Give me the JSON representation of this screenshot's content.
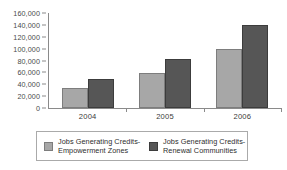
{
  "chart_data": {
    "type": "bar",
    "title": "",
    "subtitle": "",
    "xlabel": "",
    "ylabel": "",
    "categories": [
      "2004",
      "2005",
      "2006"
    ],
    "series": [
      {
        "name": "Jobs Generating Credits-\nEmpowerment Zones",
        "color": "#a7a7a7",
        "values": [
          34000,
          59000,
          99000
        ]
      },
      {
        "name": "Jobs Generating Credits-\nRenewal Communities",
        "color": "#565656",
        "values": [
          48000,
          83000,
          140000
        ]
      }
    ],
    "ylim": [
      0,
      160000
    ],
    "ytick_step": 20000,
    "ytick_labels": [
      "160,000",
      "140,000",
      "120,000",
      "100,000",
      "80,000",
      "60,000",
      "40,000",
      "20,000",
      "0"
    ],
    "ytick_values": [
      160000,
      140000,
      120000,
      100000,
      80000,
      60000,
      40000,
      20000,
      0
    ],
    "grid": false,
    "legend_position": "bottom",
    "axis_color": "#8a8a8a"
  },
  "legend": {
    "entries": [
      {
        "label": "Jobs Generating Credits-\nEmpowerment Zones"
      },
      {
        "label": "Jobs Generating Credits-\nRenewal Communities"
      }
    ]
  }
}
